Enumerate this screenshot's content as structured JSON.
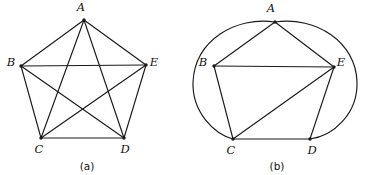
{
  "figure": {
    "stroke_color": "#1a1a1a",
    "background_color": "#ffffff",
    "panels": [
      {
        "id": "panel-a",
        "caption": "(a)",
        "caption_pos": {
          "x": 87,
          "y": 167
        },
        "description": "complete graph K5 drawn as a pentagon with all five diagonals (pentagram inside)",
        "vertices": [
          {
            "name": "A",
            "label": "A",
            "x": 84,
            "y": 20,
            "label_x": 81,
            "label_y": 8
          },
          {
            "name": "B",
            "label": "B",
            "x": 21,
            "y": 66,
            "label_x": 11,
            "label_y": 63
          },
          {
            "name": "C",
            "label": "C",
            "x": 41,
            "y": 138,
            "label_x": 39,
            "label_y": 150
          },
          {
            "name": "D",
            "label": "D",
            "x": 124,
            "y": 138,
            "label_x": 125,
            "label_y": 150
          },
          {
            "name": "E",
            "label": "E",
            "x": 146,
            "y": 65,
            "label_x": 154,
            "label_y": 63
          }
        ],
        "edges": [
          {
            "from": "A",
            "to": "B"
          },
          {
            "from": "B",
            "to": "C"
          },
          {
            "from": "C",
            "to": "D"
          },
          {
            "from": "D",
            "to": "E"
          },
          {
            "from": "E",
            "to": "A"
          },
          {
            "from": "A",
            "to": "C"
          },
          {
            "from": "A",
            "to": "D"
          },
          {
            "from": "B",
            "to": "D"
          },
          {
            "from": "B",
            "to": "E"
          },
          {
            "from": "C",
            "to": "E"
          }
        ],
        "arcs": []
      },
      {
        "id": "panel-b",
        "caption": "(b)",
        "caption_pos": {
          "x": 277,
          "y": 167
        },
        "description": "same K5 redrawn: eight straight edges plus two large outer arcs A-C and A-D",
        "vertices": [
          {
            "name": "A",
            "label": "A",
            "x": 275,
            "y": 22,
            "label_x": 271,
            "label_y": 9
          },
          {
            "name": "B",
            "label": "B",
            "x": 214,
            "y": 66,
            "label_x": 203,
            "label_y": 63
          },
          {
            "name": "C",
            "label": "C",
            "x": 233,
            "y": 139,
            "label_x": 231,
            "label_y": 151
          },
          {
            "name": "D",
            "label": "D",
            "x": 310,
            "y": 139,
            "label_x": 312,
            "label_y": 151
          },
          {
            "name": "E",
            "label": "E",
            "x": 334,
            "y": 67,
            "label_x": 341,
            "label_y": 63
          }
        ],
        "edges": [
          {
            "from": "A",
            "to": "B"
          },
          {
            "from": "B",
            "to": "C"
          },
          {
            "from": "C",
            "to": "D"
          },
          {
            "from": "D",
            "to": "E"
          },
          {
            "from": "E",
            "to": "A"
          },
          {
            "from": "B",
            "to": "E"
          },
          {
            "from": "C",
            "to": "E"
          }
        ],
        "arcs": [
          {
            "from": "A",
            "to": "C",
            "side": "left",
            "path": "M 275 22 C 236 16 195 40 193 82 C 192 112 214 134 233 139"
          },
          {
            "from": "A",
            "to": "D",
            "side": "right",
            "path": "M 275 22 C 316 16 356 42 357 82 C 358 114 333 136 310 139"
          }
        ]
      }
    ]
  }
}
